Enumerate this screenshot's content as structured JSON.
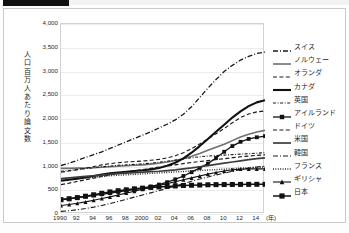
{
  "chart_data": {
    "type": "line",
    "title": "",
    "xlabel": "年",
    "ylabel": "人口百万人あたり論文数",
    "ylim": [
      0,
      4000
    ],
    "ytick_step": 500,
    "grid": true,
    "legend_position": "right",
    "x": [
      1990,
      1991,
      1992,
      1993,
      1994,
      1995,
      1996,
      1997,
      1998,
      1999,
      2000,
      2001,
      2002,
      2003,
      2004,
      2005,
      2006,
      2007,
      2008,
      2009,
      2010,
      2011,
      2012,
      2013,
      2014,
      2015
    ],
    "xtick_labels": [
      "1990",
      "92",
      "94",
      "96",
      "98",
      "2000",
      "02",
      "04",
      "06",
      "08",
      "10",
      "12",
      "14"
    ],
    "xtick_values": [
      1990,
      1992,
      1994,
      1996,
      1998,
      2000,
      2002,
      2004,
      2006,
      2008,
      2010,
      2012,
      2014
    ],
    "ytick_labels": [
      "0",
      "500",
      "1,000",
      "1,500",
      "2,000",
      "2,500",
      "3,000",
      "3,500",
      "4,000"
    ],
    "ytick_values": [
      0,
      500,
      1000,
      1500,
      2000,
      2500,
      3000,
      3500,
      4000
    ],
    "series": [
      {
        "name": "スイス",
        "style": "dashdot-long",
        "width": 1.3,
        "marker": "none",
        "color": "#1a1a1a",
        "values": [
          1020,
          1070,
          1130,
          1190,
          1250,
          1310,
          1380,
          1450,
          1520,
          1590,
          1660,
          1730,
          1810,
          1890,
          1980,
          2100,
          2260,
          2450,
          2650,
          2830,
          3000,
          3130,
          3240,
          3320,
          3380,
          3410
        ]
      },
      {
        "name": "ノルウェー",
        "style": "solid",
        "width": 1.6,
        "marker": "none",
        "color": "#6f6f6f",
        "values": [
          960,
          960,
          965,
          970,
          975,
          985,
          995,
          1005,
          1015,
          1025,
          1035,
          1050,
          1070,
          1095,
          1125,
          1165,
          1215,
          1275,
          1340,
          1405,
          1470,
          1545,
          1620,
          1680,
          1725,
          1760
        ]
      },
      {
        "name": "オランダ",
        "style": "dashed",
        "width": 1.1,
        "marker": "none",
        "color": "#1a1a1a",
        "values": [
          880,
          905,
          935,
          965,
          1000,
          1035,
          1060,
          1080,
          1095,
          1105,
          1115,
          1130,
          1150,
          1180,
          1225,
          1290,
          1375,
          1475,
          1580,
          1690,
          1800,
          1920,
          2030,
          2105,
          2150,
          2170
        ]
      },
      {
        "name": "カナダ",
        "style": "solid",
        "width": 2.1,
        "marker": "none",
        "color": "#111111",
        "values": [
          700,
          720,
          745,
          770,
          800,
          830,
          855,
          875,
          890,
          905,
          920,
          940,
          970,
          1015,
          1080,
          1170,
          1290,
          1430,
          1580,
          1730,
          1880,
          2030,
          2160,
          2270,
          2350,
          2395
        ]
      },
      {
        "name": "英国",
        "style": "dashdot",
        "width": 1.1,
        "marker": "none",
        "color": "#1a1a1a",
        "values": [
          900,
          915,
          935,
          955,
          975,
          995,
          1010,
          1025,
          1035,
          1045,
          1055,
          1070,
          1090,
          1110,
          1135,
          1160,
          1185,
          1205,
          1220,
          1230,
          1240,
          1250,
          1260,
          1270,
          1280,
          1290
        ]
      },
      {
        "name": "アイルランド",
        "style": "solid-marker",
        "width": 1.3,
        "marker": "square",
        "color": "#111111",
        "values": [
          310,
          325,
          345,
          365,
          390,
          415,
          440,
          465,
          490,
          515,
          545,
          580,
          620,
          670,
          730,
          800,
          880,
          970,
          1060,
          1180,
          1310,
          1430,
          1520,
          1580,
          1615,
          1640
        ]
      },
      {
        "name": "ドイツ",
        "style": "dashed",
        "width": 1.2,
        "marker": "none",
        "color": "#1a1a1a",
        "values": [
          620,
          650,
          685,
          720,
          755,
          790,
          825,
          855,
          885,
          910,
          935,
          960,
          985,
          1010,
          1035,
          1060,
          1085,
          1105,
          1125,
          1145,
          1165,
          1185,
          1205,
          1220,
          1235,
          1245
        ]
      },
      {
        "name": "米国",
        "style": "solid",
        "width": 1.7,
        "marker": "none",
        "color": "#3d3d3d",
        "values": [
          745,
          760,
          775,
          790,
          805,
          820,
          835,
          850,
          860,
          870,
          880,
          890,
          900,
          915,
          930,
          950,
          970,
          995,
          1020,
          1045,
          1070,
          1095,
          1120,
          1145,
          1165,
          1180
        ]
      },
      {
        "name": "韓国",
        "style": "dashdot-long",
        "width": 1.1,
        "marker": "none",
        "color": "#1a1a1a",
        "values": [
          55,
          70,
          90,
          115,
          145,
          180,
          220,
          265,
          310,
          355,
          400,
          445,
          490,
          540,
          590,
          640,
          690,
          735,
          780,
          820,
          860,
          900,
          935,
          965,
          990,
          1005
        ]
      },
      {
        "name": "フランス",
        "style": "dotted",
        "width": 1.4,
        "marker": "none",
        "color": "#1a1a1a",
        "values": [
          715,
          730,
          745,
          760,
          775,
          790,
          805,
          815,
          825,
          835,
          845,
          855,
          865,
          875,
          885,
          895,
          905,
          915,
          925,
          935,
          945,
          955,
          965,
          975,
          985,
          990
        ]
      },
      {
        "name": "ギリシャ",
        "style": "solid-marker",
        "width": 1.1,
        "marker": "triangle",
        "color": "#111111",
        "values": [
          180,
          200,
          225,
          255,
          290,
          325,
          360,
          400,
          440,
          480,
          520,
          560,
          600,
          640,
          680,
          720,
          760,
          800,
          840,
          875,
          905,
          930,
          945,
          950,
          950,
          950
        ]
      },
      {
        "name": "日本",
        "style": "solid-marker",
        "width": 1.5,
        "marker": "bigsquare",
        "color": "#111111",
        "values": [
          300,
          320,
          345,
          375,
          405,
          435,
          465,
          490,
          510,
          530,
          545,
          560,
          570,
          580,
          590,
          600,
          605,
          610,
          615,
          618,
          620,
          622,
          623,
          624,
          625,
          625
        ]
      }
    ]
  },
  "axes": {
    "y_title": "人口百万人あたり論文数",
    "x_unit_label": "(年)"
  },
  "legend": {
    "items": [
      {
        "label": "スイス"
      },
      {
        "label": "ノルウェー"
      },
      {
        "label": "オランダ"
      },
      {
        "label": "カナダ"
      },
      {
        "label": "英国"
      },
      {
        "label": "アイルランド"
      },
      {
        "label": "ドイツ"
      },
      {
        "label": "米国"
      },
      {
        "label": "韓国"
      },
      {
        "label": "フランス"
      },
      {
        "label": "ギリシャ"
      },
      {
        "label": "日本"
      }
    ]
  },
  "colors": {
    "grid": "#ececec",
    "border": "#c9c9c9",
    "text": "#2b2b2b",
    "line_default": "#1a1a1a"
  }
}
